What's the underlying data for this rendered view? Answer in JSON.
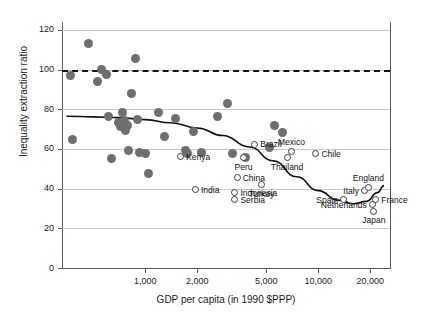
{
  "chart_data": {
    "type": "scatter",
    "title": "",
    "xlabel": "GDP per capita (in 1990 $PPP)",
    "ylabel": "Inequality extraction ratio",
    "xscale": "log",
    "xlim": [
      330,
      26000
    ],
    "ylim": [
      0,
      124
    ],
    "xticks": [
      1000,
      2000,
      5000,
      10000,
      20000
    ],
    "xticklabels": [
      "1,000",
      "2,000",
      "5,000",
      "10,000",
      "20,000"
    ],
    "yticks": [
      0,
      20,
      40,
      60,
      80,
      100,
      120
    ],
    "yticklabels": [
      "0",
      "20",
      "40",
      "60",
      "80",
      "100",
      "120"
    ],
    "grid": "horizontal",
    "legend": "none",
    "reference_line": {
      "y": 100,
      "style": "dashed",
      "label": ""
    },
    "fit_curve": {
      "name": "quadratic fit",
      "style": "solid",
      "points": [
        [
          350,
          76.5
        ],
        [
          500,
          76.2
        ],
        [
          700,
          75.8
        ],
        [
          1000,
          74.8
        ],
        [
          1400,
          73.2
        ],
        [
          2000,
          70.6
        ],
        [
          2800,
          66.8
        ],
        [
          4000,
          61.0
        ],
        [
          5500,
          54.0
        ],
        [
          7500,
          46.0
        ],
        [
          10000,
          39.0
        ],
        [
          13000,
          34.2
        ],
        [
          16000,
          32.4
        ],
        [
          19000,
          33.6
        ],
        [
          22000,
          38.0
        ],
        [
          24000,
          41.5
        ]
      ]
    },
    "series": [
      {
        "name": "unlabeled observations",
        "marker": "filled-circle",
        "color": "#6e6e6e",
        "points": [
          [
            370,
            97.0
          ],
          [
            380,
            65.0
          ],
          [
            470,
            113.0
          ],
          [
            530,
            94.0
          ],
          [
            560,
            100.0
          ],
          [
            600,
            97.5
          ],
          [
            610,
            76.5
          ],
          [
            640,
            55.0
          ],
          [
            700,
            73.5
          ],
          [
            720,
            71.5
          ],
          [
            740,
            78.5
          ],
          [
            760,
            74.5
          ],
          [
            770,
            69.5
          ],
          [
            790,
            72.0
          ],
          [
            800,
            59.0
          ],
          [
            830,
            88.0
          ],
          [
            880,
            105.5
          ],
          [
            900,
            75.0
          ],
          [
            930,
            58.0
          ],
          [
            1000,
            57.5
          ],
          [
            1050,
            47.5
          ],
          [
            1200,
            78.5
          ],
          [
            1300,
            66.5
          ],
          [
            1500,
            75.5
          ],
          [
            1700,
            59.0
          ],
          [
            1750,
            57.5
          ],
          [
            1900,
            69.0
          ],
          [
            2100,
            58.0
          ],
          [
            2600,
            76.5
          ],
          [
            3000,
            83.0
          ],
          [
            3200,
            57.5
          ],
          [
            3800,
            55.5
          ],
          [
            5200,
            60.5
          ],
          [
            5600,
            72.0
          ],
          [
            6200,
            68.5
          ]
        ]
      },
      {
        "name": "labeled countries",
        "marker": "open-circle",
        "color": "#3c3c3c",
        "points": [
          {
            "label": "Kenya",
            "x": 1600,
            "y": 56.0,
            "label_pos": "right"
          },
          {
            "label": "India",
            "x": 1950,
            "y": 39.5,
            "label_pos": "right"
          },
          {
            "label": "Brazil",
            "x": 4300,
            "y": 62.5,
            "label_pos": "right"
          },
          {
            "label": "Peru",
            "x": 3700,
            "y": 55.5,
            "label_pos": "below"
          },
          {
            "label": "China",
            "x": 3400,
            "y": 45.5,
            "label_pos": "right"
          },
          {
            "label": "Indonesia",
            "x": 3300,
            "y": 38.0,
            "label_pos": "right"
          },
          {
            "label": "Serbia",
            "x": 3300,
            "y": 34.5,
            "label_pos": "right"
          },
          {
            "label": "Turkey",
            "x": 4700,
            "y": 42.0,
            "label_pos": "below"
          },
          {
            "label": "Thailand",
            "x": 6600,
            "y": 55.5,
            "label_pos": "below"
          },
          {
            "label": "Mexico",
            "x": 7000,
            "y": 58.5,
            "label_pos": "above"
          },
          {
            "label": "Chile",
            "x": 9700,
            "y": 57.5,
            "label_pos": "right"
          },
          {
            "label": "Spain",
            "x": 14000,
            "y": 34.5,
            "label_pos": "left"
          },
          {
            "label": "Italy",
            "x": 18500,
            "y": 39.0,
            "label_pos": "left"
          },
          {
            "label": "England",
            "x": 19500,
            "y": 40.5,
            "label_pos": "above"
          },
          {
            "label": "Netherlands",
            "x": 20500,
            "y": 32.0,
            "label_pos": "left"
          },
          {
            "label": "Japan",
            "x": 21000,
            "y": 28.5,
            "label_pos": "below"
          },
          {
            "label": "France",
            "x": 21500,
            "y": 34.5,
            "label_pos": "right"
          }
        ]
      }
    ]
  }
}
